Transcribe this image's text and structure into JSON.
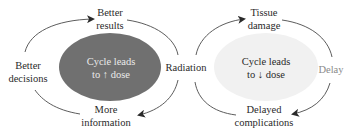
{
  "colors": {
    "left_ellipse_fill": "#707070",
    "right_ellipse_fill": "#f1f1f1",
    "arc_stroke": "#4a4a4a",
    "text": "#2a2a2a",
    "muted_text": "#8a8a8a",
    "on_dark_text": "#eaeaea"
  },
  "left_cycle": {
    "center": {
      "line1": "Cycle leads",
      "line2": "to ↑ dose"
    },
    "top": {
      "line1": "Better",
      "line2": "results"
    },
    "left": {
      "line1": "Better",
      "line2": "decisions"
    },
    "bottom": {
      "line1": "More",
      "line2": "information"
    }
  },
  "shared": {
    "middle": "Radiation"
  },
  "right_cycle": {
    "center": {
      "line1": "Cycle leads",
      "line2": "to ↓ dose"
    },
    "top": {
      "line1": "Tissue",
      "line2": "damage"
    },
    "right": "Delay",
    "bottom": {
      "line1": "Delayed",
      "line2": "complications"
    }
  }
}
